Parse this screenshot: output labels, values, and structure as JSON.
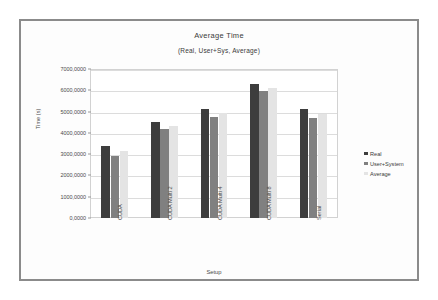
{
  "chart_data": {
    "type": "bar",
    "title": "Average Time",
    "subtitle": "(Real, User+Sys, Average)",
    "xlabel": "Setup",
    "ylabel": "Time (s)",
    "ylim": [
      0,
      7000
    ],
    "grid": true,
    "legend_position": "right",
    "categories": [
      "CUDA",
      "CUDA Multi 2",
      "CUDA Multi 4",
      "CUDA Multi 8",
      "Serial"
    ],
    "ytick_labels": [
      "0,0000",
      "1000,0000",
      "2000,0000",
      "3000,0000",
      "4000,0000",
      "5000,0000",
      "6000,0000",
      "7000,0000"
    ],
    "ytick_values": [
      0,
      1000,
      2000,
      3000,
      4000,
      5000,
      6000,
      7000
    ],
    "series": [
      {
        "name": "Real",
        "color": "#3d3d3d",
        "values": [
          3400,
          4530,
          5100,
          6300,
          5100
        ]
      },
      {
        "name": "User+System",
        "color": "#808080",
        "values": [
          2900,
          4170,
          4760,
          5980,
          4720
        ]
      },
      {
        "name": "Average",
        "color": "#e4e4e4",
        "values": [
          3150,
          4300,
          4920,
          6100,
          4880
        ]
      }
    ]
  },
  "frame": {
    "border_color": "#8b8b8b"
  }
}
